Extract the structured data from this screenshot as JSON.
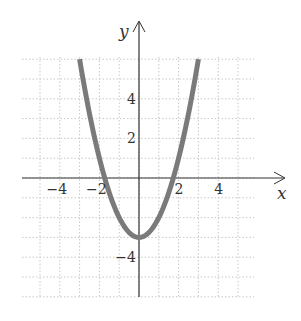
{
  "chart_data": {
    "type": "line",
    "title": "",
    "function": "y = x^2 - 3",
    "xlabel": "x",
    "ylabel": "y",
    "xlim": [
      -6,
      5.6
    ],
    "ylim": [
      -6,
      6
    ],
    "grid": true,
    "grid_step": 1,
    "x_tick_labels": [
      {
        "value": -4,
        "label": "−4"
      },
      {
        "value": -2,
        "label": "−2"
      },
      {
        "value": 2,
        "label": "2"
      },
      {
        "value": 4,
        "label": "4"
      }
    ],
    "y_tick_labels": [
      {
        "value": 4,
        "label": "4"
      },
      {
        "value": 2,
        "label": "2"
      },
      {
        "value": -4,
        "label": "−4"
      }
    ],
    "series": [
      {
        "name": "parabola",
        "color": "#7a7a7a",
        "x": [
          -3,
          -2.5,
          -2,
          -1.732,
          -1.5,
          -1,
          -0.5,
          0,
          0.5,
          1,
          1.5,
          1.732,
          2,
          2.5,
          3
        ],
        "y": [
          6,
          3.25,
          1,
          0,
          -0.75,
          -2,
          -2.75,
          -3,
          -2.75,
          -2,
          -0.75,
          0,
          1,
          3.25,
          6
        ]
      }
    ],
    "vertex": {
      "x": 0,
      "y": -3
    },
    "x_intercepts": [
      -1.732,
      1.732
    ]
  }
}
